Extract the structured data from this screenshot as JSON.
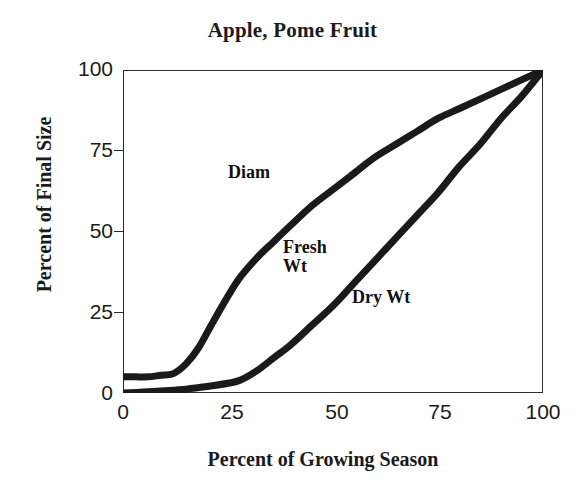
{
  "chart_data": {
    "type": "line",
    "title": "Apple, Pome Fruit",
    "xlabel": "Percent of Growing Season",
    "ylabel": "Percent of Final Size",
    "xlim": [
      0,
      100
    ],
    "ylim": [
      0,
      100
    ],
    "xticks": [
      "0",
      "25",
      "50",
      "75",
      "100"
    ],
    "yticks": [
      "0",
      "25",
      "50",
      "75",
      "100"
    ],
    "xtick_values": [
      0,
      25,
      50,
      75,
      100
    ],
    "ytick_values": [
      0,
      25,
      50,
      75,
      100
    ],
    "grid": false,
    "legend": "inline-annotations",
    "line_color": "#1a1a1a",
    "line_width": 7,
    "series": [
      {
        "name": "Diam",
        "label": "Diam",
        "x": [
          0,
          3,
          6,
          9,
          12,
          15,
          18,
          21,
          25,
          28,
          32,
          36,
          40,
          45,
          50,
          55,
          60,
          65,
          70,
          75,
          80,
          85,
          90,
          95,
          100
        ],
        "values": [
          5,
          5,
          5,
          5.5,
          6,
          9,
          14,
          21,
          30,
          36,
          42,
          47,
          52,
          58,
          63,
          68,
          73,
          77,
          81,
          85,
          88,
          91,
          94,
          97,
          100
        ]
      },
      {
        "name": "Fresh Wt",
        "label": "Fresh\nWt",
        "x": [
          0,
          5,
          10,
          15,
          20,
          25,
          28,
          32,
          36,
          40,
          45,
          50,
          55,
          60,
          65,
          70,
          75,
          80,
          85,
          90,
          95,
          100
        ],
        "values": [
          0,
          0.3,
          0.7,
          1.2,
          2,
          3,
          4,
          7,
          11,
          15,
          21,
          27,
          34,
          41,
          48,
          55,
          62,
          70,
          77,
          85,
          92,
          100
        ]
      },
      {
        "name": "Dry Wt",
        "label": "Dry Wt",
        "x": [
          0,
          5,
          10,
          15,
          20,
          25,
          28,
          32,
          36,
          40,
          45,
          50,
          55,
          60,
          65,
          70,
          75,
          80,
          85,
          90,
          95,
          100
        ],
        "values": [
          0,
          0.3,
          0.7,
          1.2,
          2,
          3,
          4,
          7,
          11,
          15,
          21,
          27,
          34,
          41,
          48,
          55,
          62,
          70,
          77,
          85,
          92,
          100
        ]
      }
    ],
    "annotations": [
      {
        "text": "Diam",
        "x": 25,
        "y": 72
      },
      {
        "text": "Fresh Wt",
        "x": 38,
        "y": 48
      },
      {
        "text": "Dry Wt",
        "x": 55,
        "y": 33
      }
    ]
  },
  "labels": {
    "diam": "Diam",
    "fresh_wt_line1": "Fresh",
    "fresh_wt_line2": "Wt",
    "dry_wt": "Dry Wt"
  }
}
